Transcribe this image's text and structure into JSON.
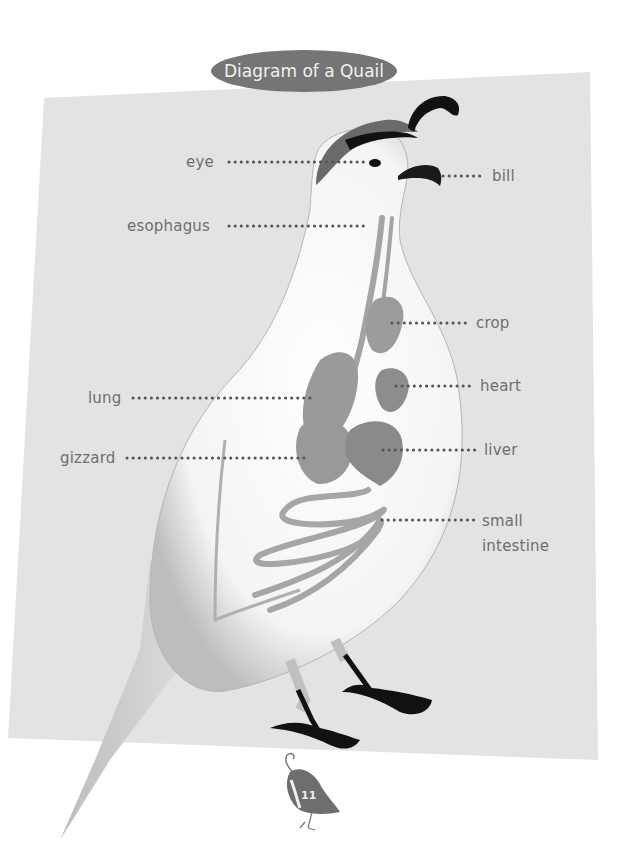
{
  "title": "Diagram of a Quail",
  "labels": {
    "eye": "eye",
    "bill": "bill",
    "esophagus": "esophagus",
    "crop": "crop",
    "lung": "lung",
    "heart": "heart",
    "gizzard": "gizzard",
    "liver": "liver",
    "small_intestine_line1": "small",
    "small_intestine_line2": "intestine"
  },
  "page_number": "11",
  "colors": {
    "panel": "#e3e3e3",
    "title_pill": "#757575",
    "label_text": "#6e6e6e",
    "leader_dots": "#555555",
    "organs": "#9a9a9a",
    "body": "#f7f7f7",
    "crest_cap": "#6a6a6a",
    "feet_bill": "#1a1a1a"
  },
  "icons": {
    "page_badge": "quail-silhouette-icon"
  }
}
